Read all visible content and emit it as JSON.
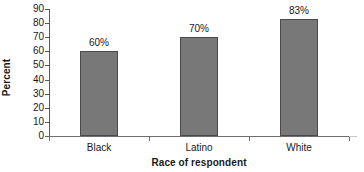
{
  "chart_data": {
    "type": "bar",
    "title": "",
    "subtitle": "",
    "categories": [
      "Black",
      "Latino",
      "White"
    ],
    "values": [
      60,
      70,
      83
    ],
    "data_labels": [
      "60%",
      "70%",
      "83%"
    ],
    "series": [
      {
        "name": "Percent",
        "values": [
          60,
          70,
          83
        ]
      }
    ],
    "xlabel": "Race of respondent",
    "ylabel": "Percent",
    "ylim": [
      0,
      90
    ],
    "ytick_step": 10,
    "ytick_labels": [
      "90",
      "80",
      "70",
      "60",
      "50",
      "40",
      "30",
      "20",
      "10",
      "0"
    ],
    "ytick_values": [
      90,
      80,
      70,
      60,
      50,
      40,
      30,
      20,
      10,
      0
    ],
    "grid": false,
    "legend": false,
    "legend_position": "none",
    "colors": {
      "bar_fill": "#787878",
      "bar_border": "#4a4a4a",
      "axis": "#6e6e6e",
      "text": "#1a1a1a",
      "background": "#ffffff"
    }
  }
}
